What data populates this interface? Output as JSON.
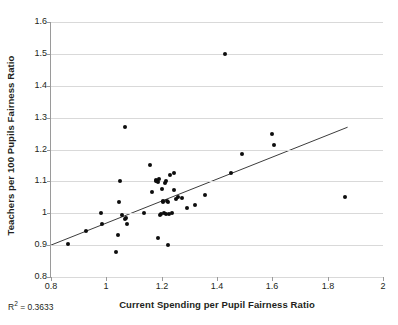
{
  "chart_data": {
    "type": "scatter",
    "title": "",
    "xlabel": "Current Spending per Pupil Fairness Ratio",
    "ylabel": "Teachers per 100 Pupils Fairness Ratio",
    "xlim": [
      0.8,
      2.0
    ],
    "ylim": [
      0.8,
      1.6
    ],
    "grid": true,
    "legend": "none",
    "xticks": [
      "0.8",
      "1",
      "1.2",
      "1.4",
      "1.6",
      "1.8",
      "2"
    ],
    "xtick_values": [
      0.8,
      1.0,
      1.2,
      1.4,
      1.6,
      1.8,
      2.0
    ],
    "yticks": [
      "0.8",
      "0.9",
      "1",
      "1.1",
      "1.2",
      "1.3",
      "1.4",
      "1.5",
      "1.6"
    ],
    "ytick_values": [
      0.8,
      0.9,
      1.0,
      1.1,
      1.2,
      1.3,
      1.4,
      1.5,
      1.6
    ],
    "annotations": [
      {
        "name": "r-squared",
        "text": "R² = 0.3633",
        "value": 0.3633
      }
    ],
    "series": [
      {
        "name": "districts",
        "marker": "filled-circle",
        "color": "#0d0d0d",
        "points": [
          [
            0.862,
            0.905
          ],
          [
            0.925,
            0.946
          ],
          [
            0.982,
            1.002
          ],
          [
            0.985,
            0.966
          ],
          [
            1.035,
            0.878
          ],
          [
            1.042,
            0.933
          ],
          [
            1.046,
            1.036
          ],
          [
            1.049,
            1.1
          ],
          [
            1.057,
            0.996
          ],
          [
            1.066,
            1.272
          ],
          [
            1.068,
            0.981
          ],
          [
            1.071,
            0.984
          ],
          [
            1.073,
            0.965
          ],
          [
            1.136,
            1.0
          ],
          [
            1.158,
            1.153
          ],
          [
            1.166,
            1.068
          ],
          [
            1.178,
            1.104
          ],
          [
            1.18,
            1.1
          ],
          [
            1.184,
            1.101
          ],
          [
            1.186,
            0.922
          ],
          [
            1.188,
            1.098
          ],
          [
            1.191,
            1.109
          ],
          [
            1.193,
            0.996
          ],
          [
            1.196,
            0.998
          ],
          [
            1.201,
            1.076
          ],
          [
            1.203,
            1.038
          ],
          [
            1.205,
            1.035
          ],
          [
            1.208,
            1.0
          ],
          [
            1.212,
            1.096
          ],
          [
            1.215,
            1.102
          ],
          [
            1.217,
            0.997
          ],
          [
            1.22,
            1.04
          ],
          [
            1.222,
            1.034
          ],
          [
            1.224,
            0.901
          ],
          [
            1.227,
            0.998
          ],
          [
            1.231,
            1.12
          ],
          [
            1.236,
            1.0
          ],
          [
            1.243,
            1.128
          ],
          [
            1.246,
            1.073
          ],
          [
            1.252,
            1.046
          ],
          [
            1.258,
            1.052
          ],
          [
            1.272,
            1.048
          ],
          [
            1.292,
            1.018
          ],
          [
            1.322,
            1.027
          ],
          [
            1.358,
            1.057
          ],
          [
            1.428,
            1.5
          ],
          [
            1.45,
            1.126
          ],
          [
            1.489,
            1.186
          ],
          [
            1.598,
            1.25
          ],
          [
            1.607,
            1.214
          ],
          [
            1.862,
            1.05
          ]
        ]
      }
    ],
    "trendline": {
      "name": "linear-fit",
      "color": "#3c3c3c",
      "x_start": 0.8,
      "y_start": 0.9,
      "x_end": 1.872,
      "y_end": 1.27
    }
  }
}
